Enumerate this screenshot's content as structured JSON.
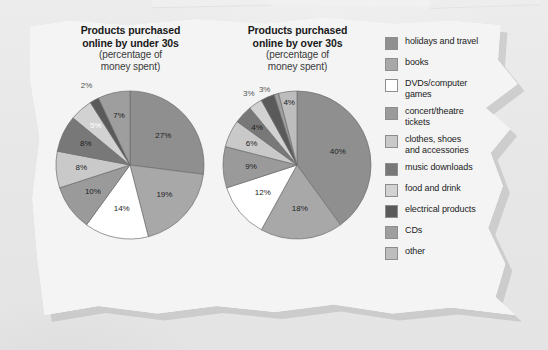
{
  "page": {
    "background_color": "#e9e9e9",
    "sheet_color": "#f4f4f4"
  },
  "chart_data": [
    {
      "type": "pie",
      "id": "under-30s",
      "title": "Products purchased\nonline by under 30s",
      "subtitle": "(percentage of\nmoney spent)",
      "title_line1": "Products purchased",
      "title_line2": "online by under 30s",
      "subtitle_line1": "(percentage of",
      "subtitle_line2": "money spent)",
      "unit": "%",
      "categories": [
        "holidays and travel",
        "books",
        "DVDs/computer games",
        "concert/theatre tickets",
        "clothes, shoes and accessories",
        "music downloads",
        "food and drink",
        "electrical products",
        "CDs",
        "other"
      ],
      "values": [
        27,
        19,
        14,
        10,
        8,
        8,
        5,
        2,
        7,
        0
      ],
      "labels": [
        "27%",
        "19%",
        "14%",
        "10%",
        "8%",
        "8%",
        "5%",
        "2%",
        "7%",
        ""
      ],
      "colors": [
        "#8f8f8f",
        "#a8a8a8",
        "#ffffff",
        "#9a9a9a",
        "#c9c9c9",
        "#787878",
        "#d2d2d2",
        "#5a5a5a",
        "#9e9e9e",
        "#bdbdbd"
      ],
      "start_angle": 0,
      "legend_position": "right"
    },
    {
      "type": "pie",
      "id": "over-30s",
      "title": "Products purchased\nonline by over 30s",
      "subtitle": "(percentage of\nmoney spent)",
      "title_line1": "Products purchased",
      "title_line2": "online by over 30s",
      "subtitle_line1": "(percentage of",
      "subtitle_line2": "money spent)",
      "unit": "%",
      "categories": [
        "holidays and travel",
        "books",
        "DVDs/computer games",
        "concert/theatre tickets",
        "clothes, shoes and accessories",
        "music downloads",
        "food and drink",
        "electrical products",
        "CDs",
        "other"
      ],
      "values": [
        40,
        18,
        12,
        9,
        6,
        4,
        3,
        3,
        1,
        4
      ],
      "labels": [
        "40%",
        "18%",
        "12%",
        "9%",
        "6%",
        "4%",
        "3%",
        "3%",
        "1%",
        "4%"
      ],
      "colors": [
        "#8f8f8f",
        "#a8a8a8",
        "#ffffff",
        "#9a9a9a",
        "#c9c9c9",
        "#787878",
        "#d2d2d2",
        "#5a5a5a",
        "#9e9e9e",
        "#bdbdbd"
      ],
      "start_angle": 0,
      "legend_position": "right"
    }
  ],
  "legend": {
    "items": [
      {
        "label": "holidays and travel",
        "color": "#8f8f8f"
      },
      {
        "label": "books",
        "color": "#a8a8a8"
      },
      {
        "label": "DVDs/computer\ngames",
        "color": "#ffffff"
      },
      {
        "label": "concert/theatre\ntickets",
        "color": "#9a9a9a"
      },
      {
        "label": "clothes, shoes\nand accessories",
        "color": "#c9c9c9"
      },
      {
        "label": "music downloads",
        "color": "#787878"
      },
      {
        "label": "food and drink",
        "color": "#d2d2d2"
      },
      {
        "label": "electrical products",
        "color": "#5a5a5a"
      },
      {
        "label": "CDs",
        "color": "#9e9e9e"
      },
      {
        "label": "other",
        "color": "#bdbdbd"
      }
    ]
  }
}
